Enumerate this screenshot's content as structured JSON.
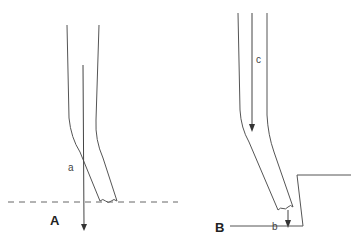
{
  "figure": {
    "panels": [
      {
        "id": "A",
        "label": "A",
        "annotations": [
          {
            "id": "a",
            "text": "a"
          }
        ]
      },
      {
        "id": "B",
        "label": "B",
        "annotations": [
          {
            "id": "c",
            "text": "c"
          },
          {
            "id": "b",
            "text": "b"
          }
        ]
      }
    ]
  }
}
